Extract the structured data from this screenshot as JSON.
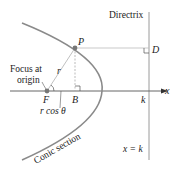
{
  "labels": {
    "directrix": "Directrix",
    "point_p": "P",
    "point_d": "D",
    "point_f": "F",
    "point_b": "B",
    "focus_line1": "Focus at",
    "focus_line2": "origin",
    "r": "r",
    "rcos": "r cos θ",
    "x_axis": "x",
    "k": "k",
    "x_eq_k": "x = k",
    "conic": "Conic section"
  },
  "colors": {
    "curve": "#8a8a8a",
    "lines": "#9a9a9a",
    "axis": "#555555",
    "text": "#222222",
    "point": "#777777"
  }
}
